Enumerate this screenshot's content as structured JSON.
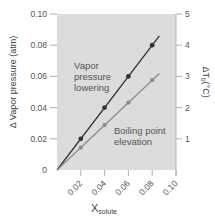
{
  "chart_data": {
    "type": "line",
    "title": "",
    "xlabel": "X",
    "xlabel_sub": "solute",
    "ylabel": "Δ Vapor pressure (atm)",
    "y2label": "ΔT",
    "y2label_sub": "b",
    "y2label_unit": "(°C)",
    "xlim": [
      0,
      0.1
    ],
    "ylim": [
      0,
      0.1
    ],
    "y2lim": [
      0,
      5
    ],
    "x_ticks": [
      0.02,
      0.04,
      0.06,
      0.08,
      0.1
    ],
    "x_tick_labels": [
      "0.02",
      "0.04",
      "0.06",
      "0.08",
      "0.10"
    ],
    "y_ticks": [
      0,
      0.02,
      0.04,
      0.06,
      0.08,
      0.1
    ],
    "y_tick_labels": [
      "0",
      "0.02",
      "0.04",
      "0.06",
      "0.08",
      "0.10"
    ],
    "y2_ticks": [
      1,
      2,
      3,
      4,
      5
    ],
    "y2_tick_labels": [
      "1",
      "2",
      "3",
      "4",
      "5"
    ],
    "grid": false,
    "series": [
      {
        "name": "Vapor pressure lowering",
        "axis": "left",
        "color": "#333333",
        "line_x": [
          0,
          0.086
        ],
        "x": [
          0.02,
          0.04,
          0.06,
          0.08
        ],
        "values": [
          0.02,
          0.04,
          0.06,
          0.08
        ]
      },
      {
        "name": "Boiling point elevation",
        "axis": "right",
        "color": "#8c8c8c",
        "line_x": [
          0,
          0.086
        ],
        "x": [
          0.02,
          0.04,
          0.06,
          0.08
        ],
        "values": [
          0.72,
          1.44,
          2.16,
          2.88
        ]
      }
    ],
    "annotations": [
      {
        "lines": [
          "Vapor",
          "pressure",
          "lowering"
        ],
        "series": 0
      },
      {
        "lines": [
          "Boiling point",
          "elevation"
        ],
        "series": 1
      }
    ],
    "plot_background": "#dcdcdc"
  }
}
